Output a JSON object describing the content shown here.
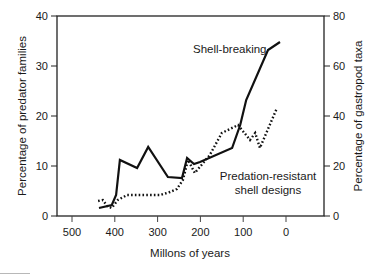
{
  "chart_data": {
    "type": "line",
    "title": "",
    "xlabel": "Millons of years",
    "ylabel": "Percentage of predator families",
    "y2label": "Percentage of gastropod taxa",
    "xlim": [
      535,
      -90
    ],
    "x_reversed": true,
    "ylim": [
      0,
      40
    ],
    "y2lim": [
      0,
      80
    ],
    "x_ticks": [
      500,
      400,
      300,
      200,
      100,
      0
    ],
    "y_ticks": [
      0,
      10,
      20,
      30,
      40
    ],
    "y2_ticks": [
      0,
      20,
      40,
      60,
      80
    ],
    "grid": false,
    "legend": "none (inline annotations)",
    "series": [
      {
        "name": "Shell-breaking",
        "axis": "left",
        "style": "solid",
        "color": "#111111",
        "x": [
          437,
          407,
          397,
          388,
          348,
          322,
          276,
          243,
          231,
          215,
          201,
          126,
          107,
          93,
          42,
          14
        ],
        "values": [
          1.6,
          2.2,
          4.2,
          11.2,
          9.6,
          13.8,
          7.8,
          7.6,
          11.6,
          10.4,
          10.8,
          13.6,
          18.2,
          23.2,
          33.2,
          34.8
        ]
      },
      {
        "name": "Predation-resistant shell designs",
        "axis": "right",
        "style": "dotted",
        "color": "#111111",
        "x": [
          439,
          428,
          418,
          407,
          393,
          371,
          294,
          271,
          255,
          241,
          229,
          213,
          178,
          150,
          112,
          84,
          72,
          61,
          21
        ],
        "values": [
          6.0,
          6.4,
          4.0,
          3.2,
          6.4,
          8.4,
          8.4,
          9.6,
          10.8,
          14.4,
          22.4,
          17.2,
          24.4,
          33.2,
          36.4,
          30.4,
          33.2,
          27.2,
          43.2
        ]
      }
    ],
    "annotations": [
      {
        "text": "Shell-breaking",
        "series": 0
      },
      {
        "lines": [
          "Predation-resistant",
          "shell designs"
        ],
        "series": 1
      }
    ]
  },
  "labels": {
    "x_axis_title": "Millons of years",
    "y_axis_left_title": "Percentage of predator families",
    "y_axis_right_title": "Percentage of gastropod taxa",
    "annotation_solid": "Shell-breaking",
    "annotation_dotted_line1": "Predation-resistant",
    "annotation_dotted_line2": "shell designs"
  },
  "colors": {
    "line": "#111111",
    "axis": "#222222",
    "background": "#ffffff"
  }
}
